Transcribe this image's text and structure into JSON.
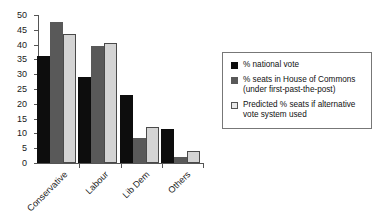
{
  "chart_data": {
    "type": "bar",
    "title": "",
    "xlabel": "",
    "ylabel": "",
    "ylim": [
      0,
      50
    ],
    "ytick_step": 5,
    "yticks": [
      0,
      5,
      10,
      15,
      20,
      25,
      30,
      35,
      40,
      45,
      50
    ],
    "grid": false,
    "legend_position": "right",
    "categories": [
      "Conservative",
      "Labour",
      "Lib Dem",
      "Others"
    ],
    "series": [
      {
        "name": "% national vote",
        "color": "#0d0d0d",
        "values": [
          36,
          29,
          23,
          11.5
        ]
      },
      {
        "name": "% seats in House of Commons (under first-past-the-post)",
        "color": "#595959",
        "values": [
          47.5,
          39.5,
          8.5,
          2
        ]
      },
      {
        "name": "Predicted % seats if alternative vote system used",
        "color": "#d4d4d4",
        "values": [
          43.5,
          40.5,
          12,
          4
        ]
      }
    ]
  },
  "legend": {
    "items": [
      {
        "label": "% national vote",
        "swatch": "black-swatch"
      },
      {
        "label": "% seats in House of Commons (under first-past-the-post)",
        "swatch": "dark-gray-swatch"
      },
      {
        "label": "Predicted % seats if alternative vote system used",
        "swatch": "light-gray-swatch"
      }
    ]
  }
}
